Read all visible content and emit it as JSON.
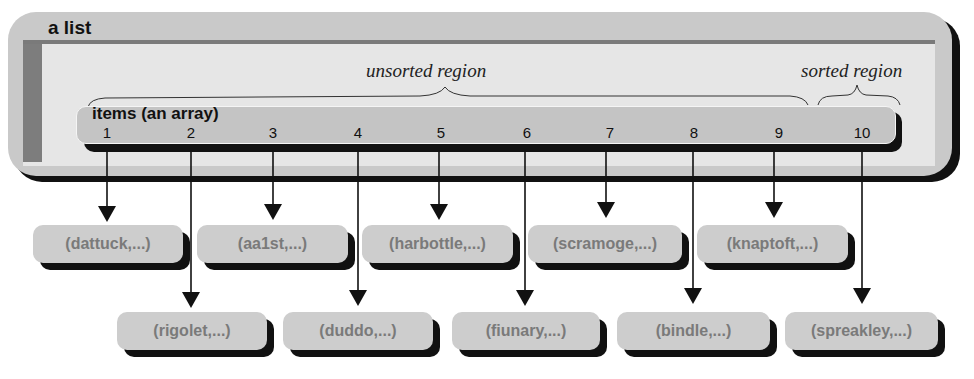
{
  "list_panel": {
    "title": "a list",
    "unsorted_label": "unsorted region",
    "sorted_label": "sorted region"
  },
  "array": {
    "title": "items (an array)",
    "indices": [
      "1",
      "2",
      "3",
      "4",
      "5",
      "6",
      "7",
      "8",
      "9",
      "10"
    ]
  },
  "records": [
    {
      "index": 1,
      "label": "(dattuck,...)",
      "row": "top"
    },
    {
      "index": 2,
      "label": "(rigolet,...)",
      "row": "bottom"
    },
    {
      "index": 3,
      "label": "(aa1st,...)",
      "row": "top"
    },
    {
      "index": 4,
      "label": "(duddo,...)",
      "row": "bottom"
    },
    {
      "index": 5,
      "label": "(harbottle,...)",
      "row": "top"
    },
    {
      "index": 6,
      "label": "(fiunary,...)",
      "row": "bottom"
    },
    {
      "index": 7,
      "label": "(scramoge,...)",
      "row": "top"
    },
    {
      "index": 8,
      "label": "(bindle,...)",
      "row": "bottom"
    },
    {
      "index": 9,
      "label": "(knaptoft,...)",
      "row": "top"
    },
    {
      "index": 10,
      "label": "(spreakley,...)",
      "row": "bottom"
    }
  ]
}
